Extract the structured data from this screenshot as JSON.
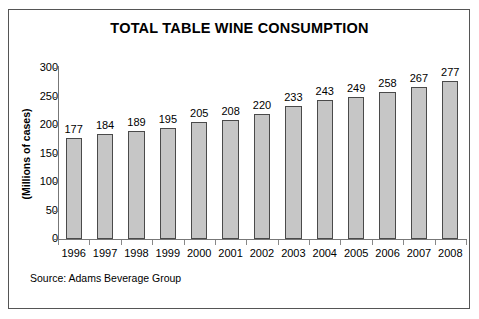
{
  "chart_data": {
    "type": "bar",
    "title": "TOTAL TABLE WINE CONSUMPTION",
    "xlabel": "",
    "ylabel": "(Millions of cases)",
    "categories": [
      "1996",
      "1997",
      "1998",
      "1999",
      "2000",
      "2001",
      "2002",
      "2003",
      "2004",
      "2005",
      "2006",
      "2007",
      "2008"
    ],
    "values": [
      177,
      184,
      189,
      195,
      205,
      208,
      220,
      233,
      243,
      249,
      258,
      267,
      277
    ],
    "data_labels": [
      "177",
      "184",
      "189",
      "195",
      "205",
      "208",
      "220",
      "233",
      "243",
      "249",
      "258",
      "267",
      "277"
    ],
    "ylim": [
      0,
      300
    ],
    "yticks": [
      0,
      50,
      100,
      150,
      200,
      250,
      300
    ],
    "ytick_labels": [
      "0",
      "50",
      "100",
      "150",
      "200",
      "250",
      "300"
    ],
    "grid": false,
    "legend": null,
    "bar_color": "#c6c6c6",
    "bar_edge_color": "#4a4a4a",
    "axis_color": "#777777",
    "text_color": "#000000",
    "background": "#ffffff",
    "frame_color": "#555555",
    "annotations": [
      "Source: Adams Beverage Group"
    ]
  },
  "figure": {
    "source_note": "Source: Adams Beverage Group"
  }
}
